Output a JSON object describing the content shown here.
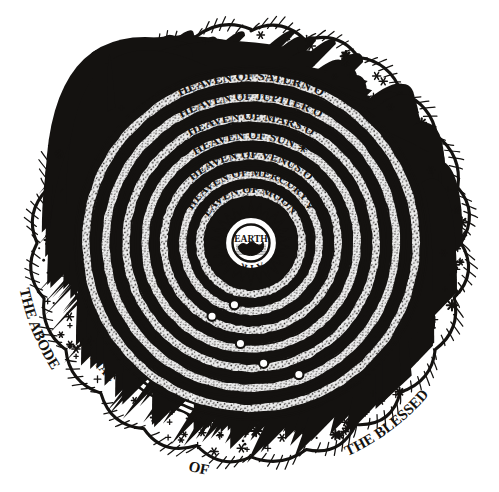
{
  "figure": {
    "style": "engraving",
    "ink_color": "#141210",
    "paper_color": "#ffffff",
    "center": {
      "x": 251,
      "y": 243
    }
  },
  "center_core": {
    "earth_label": "EARTH",
    "fire_label": "FIRE",
    "air_label": "AIR",
    "water_label": "WATER"
  },
  "spheres": [
    {
      "index": 0,
      "label": "HEAVEN OF MOON",
      "symbol": "moon-symbol",
      "symbol_glyph": "O",
      "radius": 56,
      "label_radius": 50,
      "arc_span": 128
    },
    {
      "index": 1,
      "label": "HEAVEN OF MERCURY",
      "symbol": "mercury-symbol",
      "symbol_glyph": "☿",
      "radius": 73,
      "label_radius": 67,
      "arc_span": 134
    },
    {
      "index": 2,
      "label": "HEAVEN OF VENUS",
      "symbol": "venus-symbol",
      "symbol_glyph": "O",
      "radius": 92,
      "label_radius": 85,
      "arc_span": 136
    },
    {
      "index": 3,
      "label": "HEAVEN OF SUN",
      "symbol": "sun-symbol",
      "symbol_glyph": "☀",
      "radius": 111,
      "label_radius": 104,
      "arc_span": 132
    },
    {
      "index": 4,
      "label": "HEAVEN OF MARS",
      "symbol": "mars-symbol",
      "symbol_glyph": "O",
      "radius": 130,
      "label_radius": 123,
      "arc_span": 130
    },
    {
      "index": 5,
      "label": "HEAVEN OF JUPITER",
      "symbol": "jupiter-symbol",
      "symbol_glyph": "O",
      "radius": 150,
      "label_radius": 143,
      "arc_span": 130
    },
    {
      "index": 6,
      "label": "HEAVEN OF SATURN",
      "symbol": "saturn-symbol",
      "symbol_glyph": "O",
      "radius": 170,
      "label_radius": 163,
      "arc_span": 128
    }
  ],
  "outer_ring": {
    "fixed_stars_label": "F I X E D  S T A R S",
    "fixed_stars_top_text": "FIXED STARS",
    "fixed_stars_bottom_text": "FIXED STARS",
    "zodiac_right_text": "ZODIAC",
    "zodiac_left_text": "ZODIAC",
    "star_band_inner_radius": 182,
    "star_band_outer_radius": 216
  },
  "cloud_border": {
    "name": "scalloped-cloud-border",
    "lobe_count": 24,
    "base_radius": 212,
    "lobe_height": 17
  },
  "inscription": {
    "left_text": "THE ABODE",
    "bottom_left_text": "OF",
    "bottom_text": "THE BLESSED",
    "full_text": "THE ABODE OF THE BLESSED",
    "radius": 236
  }
}
